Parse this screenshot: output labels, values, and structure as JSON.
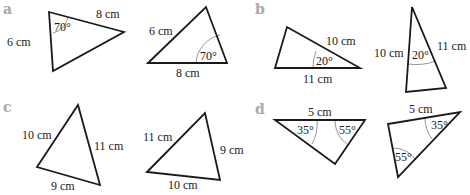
{
  "figure": {
    "colors": {
      "line": "#1a1a1a",
      "arc": "#8a8a8a",
      "part_label": "#a9a9a9",
      "background": "#ffffff"
    },
    "parts": [
      {
        "label": "a",
        "triangles": [
          {
            "points": "49,12 124,32 53,71",
            "sides": [
              {
                "text": "8 cm",
                "x": 96,
                "y": 18
              },
              {
                "text": "6 cm",
                "x": 7,
                "y": 46
              }
            ],
            "angles": [
              {
                "text": "70°",
                "x": 54,
                "y": 31,
                "arc": "M 53,33 A 20,20 0 0 0 68,17"
              }
            ]
          },
          {
            "points": "148,63 206,7 227,63",
            "sides": [
              {
                "text": "6 cm",
                "x": 149,
                "y": 35
              },
              {
                "text": "8 cm",
                "x": 176,
                "y": 77
              }
            ],
            "angles": [
              {
                "text": "70°",
                "x": 200,
                "y": 60,
                "arc": "M 196,63 A 31,31 0 0 1 220,35"
              }
            ]
          }
        ]
      },
      {
        "label": "b",
        "triangles": [
          {
            "points": "275,68 287,27 360,68",
            "sides": [
              {
                "text": "10 cm",
                "x": 326,
                "y": 45
              },
              {
                "text": "11 cm",
                "x": 303,
                "y": 83
              }
            ],
            "angles": [
              {
                "text": "20°",
                "x": 316,
                "y": 65,
                "arc": "M 313,68 A 47,47 0 0 1 316,51"
              }
            ]
          },
          {
            "points": "412,7 406,92 446,88",
            "sides": [
              {
                "text": "10 cm",
                "x": 374,
                "y": 57
              },
              {
                "text": "11 cm",
                "x": 437,
                "y": 50
              }
            ],
            "angles": [
              {
                "text": "20°",
                "x": 412,
                "y": 59,
                "arc": "M 408,64 A 58,58 0 0 0 436,61"
              }
            ]
          }
        ]
      },
      {
        "label": "c",
        "triangles": [
          {
            "points": "37,167 78,105 100,185",
            "sides": [
              {
                "text": "10 cm",
                "x": 22,
                "y": 139
              },
              {
                "text": "11 cm",
                "x": 94,
                "y": 150
              },
              {
                "text": "9 cm",
                "x": 51,
                "y": 190
              }
            ],
            "angles": []
          },
          {
            "points": "147,172 205,113 220,180",
            "sides": [
              {
                "text": "11 cm",
                "x": 143,
                "y": 141
              },
              {
                "text": "9 cm",
                "x": 220,
                "y": 154
              },
              {
                "text": "10 cm",
                "x": 168,
                "y": 189
              }
            ],
            "angles": []
          }
        ]
      },
      {
        "label": "d",
        "triangles": [
          {
            "points": "275,120 365,120 335,164",
            "sides": [
              {
                "text": "5 cm",
                "x": 308,
                "y": 116
              },
              {
                "text": "",
                "x": 0,
                "y": 0
              }
            ],
            "angles": [
              {
                "text": "35°",
                "x": 297,
                "y": 134,
                "arc": "M 317,120 A 42,42 0 0 1 312,144"
              },
              {
                "text": "55°",
                "x": 339,
                "y": 134,
                "arc": "M 335,120 A 30,30 0 0 0 348,145"
              }
            ]
          },
          {
            "points": "388,124 460,112 398,177",
            "sides": [
              {
                "text": "5 cm",
                "x": 409,
                "y": 113
              },
              {
                "text": "",
                "x": 0,
                "y": 0
              }
            ],
            "angles": [
              {
                "text": "35°",
                "x": 431,
                "y": 129,
                "arc": "M 425,117 A 36,36 0 0 0 432,139"
              },
              {
                "text": "55°",
                "x": 395,
                "y": 161,
                "arc": "M 393,148 A 29,29 0 0 1 416,160"
              }
            ]
          }
        ]
      }
    ]
  }
}
